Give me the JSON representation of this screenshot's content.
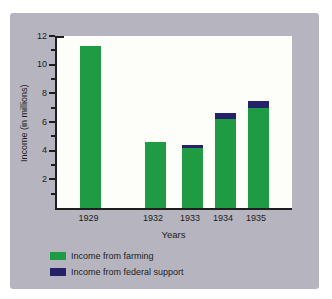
{
  "chart_data": {
    "type": "bar",
    "stacked": true,
    "title": "",
    "categories": [
      "1929",
      "1932",
      "1933",
      "1934",
      "1935"
    ],
    "series": [
      {
        "name": "Income from farming",
        "color": "#1f9b43",
        "values": [
          11.3,
          4.6,
          4.2,
          6.2,
          7.0
        ]
      },
      {
        "name": "Income from federal support",
        "color": "#262268",
        "values": [
          0,
          0,
          0.2,
          0.45,
          0.5
        ]
      }
    ],
    "xlabel": "Years",
    "ylabel": "Income (in millions)",
    "ylim": [
      0,
      12
    ],
    "yticks": [
      2,
      4,
      6,
      8,
      10,
      12
    ],
    "minor_yticks": [
      1,
      3,
      5,
      7,
      9,
      11
    ],
    "grid": false,
    "legend_position": "bottom-left"
  },
  "legend": {
    "items": [
      {
        "label": "Income from farming",
        "color": "#1f9b43"
      },
      {
        "label": "Income from federal support",
        "color": "#262268"
      }
    ]
  },
  "colors": {
    "page_background": "#ffffff",
    "card_background": "#b6b5bf",
    "plot_background": "#fdfdf9",
    "axis": "#1e1e1e",
    "farming_green": "#1f9b43",
    "federal_navy": "#262268"
  }
}
